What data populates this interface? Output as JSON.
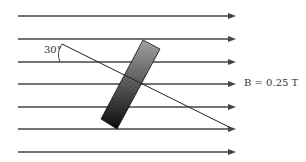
{
  "diagram": {
    "field_label": "B = 0.25 T",
    "angle_label": "30°",
    "field_lines_y": [
      16,
      39,
      62,
      84,
      107,
      129,
      152
    ],
    "field_line_x_start": 18,
    "field_line_x_end": 236,
    "line_color": "#444444",
    "coil": {
      "corners": [
        [
          143,
          40
        ],
        [
          160,
          49
        ],
        [
          117,
          129
        ],
        [
          101,
          119
        ]
      ],
      "gradient_top": "#b0b0b0",
      "gradient_bottom": "#111111"
    },
    "normal_line": {
      "x1": 62,
      "y1": 44,
      "x2": 229,
      "y2": 127
    }
  }
}
